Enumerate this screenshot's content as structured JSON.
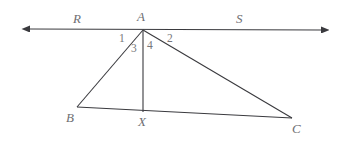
{
  "figure": {
    "background_color": "#ffffff",
    "stroke_color": "#3a3a3e",
    "label_color": "#6e6e72",
    "angle_label_color": "#76767a"
  },
  "points": {
    "A": {
      "label": "A",
      "x": 143,
      "y": 30,
      "label_x": 137,
      "label_y": 10
    },
    "B": {
      "label": "B",
      "x": 77,
      "y": 107,
      "label_x": 66,
      "label_y": 111
    },
    "C": {
      "label": "C",
      "x": 292,
      "y": 118,
      "label_x": 292,
      "label_y": 122
    },
    "X": {
      "label": "X",
      "x": 143,
      "y": 112,
      "label_x": 138,
      "label_y": 115
    }
  },
  "rays": {
    "left_tip": {
      "x": 26,
      "y": 29
    },
    "right_tip": {
      "x": 325,
      "y": 30
    },
    "R": {
      "label": "R",
      "label_x": 73,
      "label_y": 12
    },
    "S": {
      "label": "S",
      "label_x": 236,
      "label_y": 12
    }
  },
  "angles": [
    {
      "name": "angle-1",
      "label": "1",
      "x": 119,
      "y": 33
    },
    {
      "name": "angle-2",
      "label": "2",
      "x": 167,
      "y": 33
    },
    {
      "name": "angle-3",
      "label": "3",
      "x": 131,
      "y": 43
    },
    {
      "name": "angle-4",
      "label": "4",
      "x": 147,
      "y": 40
    }
  ],
  "segments": [
    {
      "name": "segment-ab",
      "from": "A",
      "to": "B"
    },
    {
      "name": "segment-ac",
      "from": "A",
      "to": "C"
    },
    {
      "name": "segment-ax",
      "from": "A",
      "to": "X"
    },
    {
      "name": "segment-bc",
      "from": "B",
      "to": "C"
    }
  ]
}
